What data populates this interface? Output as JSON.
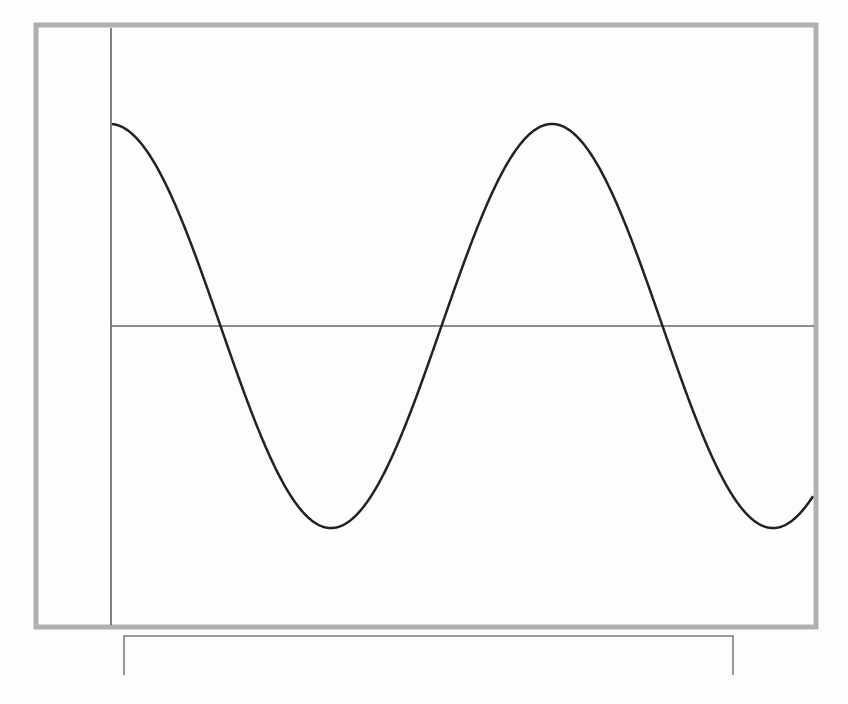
{
  "figure": {
    "width": 848,
    "height": 704,
    "background": "#fdfdfd",
    "frame": {
      "x": 36,
      "y": 25,
      "width": 780,
      "height": 602,
      "stroke": "#b0b0b0",
      "stroke_width": 5
    },
    "y_axis": {
      "x": 111,
      "y1": 28,
      "y2": 625,
      "stroke": "#555555",
      "stroke_width": 1.5
    },
    "x_axis": {
      "y": 326,
      "x1": 111,
      "x2": 814,
      "stroke": "#666666",
      "stroke_width": 1.5
    },
    "curve": {
      "stroke": "#222222",
      "stroke_width": 2.5,
      "center_y": 326,
      "amplitude_px": 202,
      "period_px": 442,
      "peak_x": 110,
      "x_start": 112,
      "x_end": 813
    },
    "bracket": {
      "x1": 124,
      "x2": 733,
      "y_top": 636,
      "y_bottom": 675,
      "stroke": "#777777",
      "stroke_width": 1.5
    }
  },
  "chart_data": {
    "type": "line",
    "title": "",
    "xlabel": "",
    "ylabel": "",
    "series": [
      {
        "name": "wave",
        "function": "y = cos(x)",
        "x_cycles": [
          0,
          0.25,
          0.5,
          0.75,
          1.0,
          1.25,
          1.5,
          1.59
        ],
        "values": [
          1.0,
          0.0,
          -1.0,
          0.0,
          1.0,
          0.0,
          -1.0,
          -0.84
        ]
      }
    ],
    "key_points_px": {
      "start": [
        112,
        127
      ],
      "zero_crossings": [
        [
          220,
          326
        ],
        [
          442,
          326
        ],
        [
          662,
          326
        ]
      ],
      "troughs": [
        [
          332,
          527
        ],
        [
          773,
          533
        ]
      ],
      "peaks": [
        [
          552,
          122
        ]
      ],
      "end": [
        813,
        500
      ]
    },
    "ylim": [
      -1,
      1
    ],
    "grid": false,
    "legend": null
  }
}
